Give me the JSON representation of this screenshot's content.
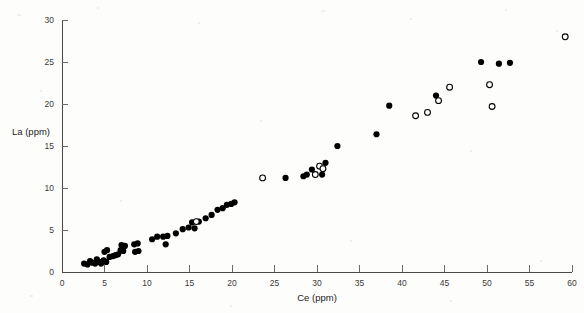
{
  "chart_data": {
    "type": "scatter",
    "title": "",
    "subtitle": "",
    "xlabel": "Ce (ppm)",
    "ylabel": "La (ppm)",
    "xlim": [
      0,
      60
    ],
    "ylim": [
      0,
      30
    ],
    "xticks": [
      0,
      5,
      10,
      15,
      20,
      25,
      30,
      35,
      40,
      45,
      50,
      55,
      60
    ],
    "xtick_labels": [
      "0",
      "5",
      "10",
      "15",
      "20",
      "25",
      "30",
      "35",
      "40",
      "45",
      "50",
      "55",
      "60"
    ],
    "yticks": [
      0,
      5,
      10,
      15,
      20,
      25,
      30
    ],
    "ytick_labels": [
      "0",
      "5",
      "10",
      "15",
      "20",
      "25",
      "30"
    ],
    "grid": false,
    "legend": null,
    "legend_position": "none",
    "annotations": [],
    "series": [
      {
        "name": "filled-circles",
        "marker": "filled-circle",
        "color": "#000000",
        "points": [
          [
            2.6,
            1.0
          ],
          [
            3.0,
            0.9
          ],
          [
            3.3,
            1.3
          ],
          [
            3.6,
            1.1
          ],
          [
            3.9,
            1.0
          ],
          [
            4.1,
            1.5
          ],
          [
            4.4,
            1.2
          ],
          [
            4.6,
            1.0
          ],
          [
            4.9,
            1.4
          ],
          [
            5.2,
            1.2
          ],
          [
            5.0,
            2.4
          ],
          [
            5.3,
            2.6
          ],
          [
            5.6,
            1.8
          ],
          [
            6.0,
            1.9
          ],
          [
            6.3,
            2.0
          ],
          [
            6.6,
            2.1
          ],
          [
            6.9,
            2.6
          ],
          [
            7.2,
            2.5
          ],
          [
            7.0,
            3.2
          ],
          [
            7.4,
            3.1
          ],
          [
            8.5,
            3.3
          ],
          [
            8.9,
            3.4
          ],
          [
            8.6,
            2.4
          ],
          [
            9.0,
            2.5
          ],
          [
            10.6,
            3.9
          ],
          [
            11.2,
            4.2
          ],
          [
            11.9,
            4.2
          ],
          [
            12.4,
            4.3
          ],
          [
            12.2,
            3.3
          ],
          [
            13.4,
            4.6
          ],
          [
            14.2,
            5.1
          ],
          [
            14.9,
            5.3
          ],
          [
            15.3,
            5.9
          ],
          [
            15.6,
            5.2
          ],
          [
            16.1,
            6.0
          ],
          [
            16.9,
            6.4
          ],
          [
            17.6,
            6.8
          ],
          [
            18.3,
            7.4
          ],
          [
            18.9,
            7.6
          ],
          [
            19.4,
            8.0
          ],
          [
            19.9,
            8.1
          ],
          [
            20.3,
            8.3
          ],
          [
            26.3,
            11.2
          ],
          [
            28.4,
            11.4
          ],
          [
            28.8,
            11.6
          ],
          [
            29.4,
            12.2
          ],
          [
            30.6,
            11.6
          ],
          [
            31.0,
            13.0
          ],
          [
            32.4,
            15.0
          ],
          [
            37.0,
            16.4
          ],
          [
            38.5,
            19.8
          ],
          [
            44.0,
            21.0
          ],
          [
            49.3,
            25.0
          ],
          [
            51.4,
            24.8
          ],
          [
            52.7,
            24.9
          ]
        ]
      },
      {
        "name": "open-circles",
        "marker": "open-circle",
        "color": "#000000",
        "points": [
          [
            15.8,
            6.0
          ],
          [
            23.6,
            11.2
          ],
          [
            29.8,
            11.6
          ],
          [
            30.3,
            12.6
          ],
          [
            30.7,
            12.3
          ],
          [
            41.6,
            18.6
          ],
          [
            43.0,
            19.0
          ],
          [
            44.3,
            20.4
          ],
          [
            45.6,
            22.0
          ],
          [
            50.3,
            22.3
          ],
          [
            50.6,
            19.7
          ],
          [
            59.2,
            28.0
          ]
        ]
      }
    ]
  },
  "axes": {
    "x_axis_name": "x-axis",
    "y_axis_name": "y-axis"
  }
}
